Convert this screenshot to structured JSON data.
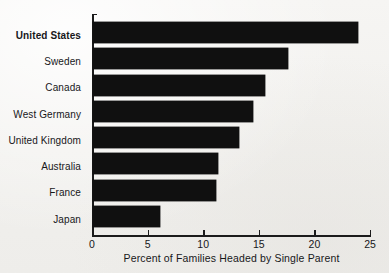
{
  "chart_data": {
    "type": "bar",
    "orientation": "horizontal",
    "title": "",
    "xlabel": "Percent of Families Headed by Single Parent",
    "ylabel": "",
    "xlim": [
      0,
      25
    ],
    "xticks": [
      0,
      5,
      10,
      15,
      20,
      25
    ],
    "xtick_labels": [
      "0",
      "5",
      "10",
      "15",
      "20",
      "25"
    ],
    "grid": false,
    "legend": null,
    "categories": [
      "United States",
      "Sweden",
      "Canada",
      "West Germany",
      "United Kingdom",
      "Australia",
      "France",
      "Japan"
    ],
    "values": [
      23.8,
      17.5,
      15.5,
      14.4,
      13.1,
      11.2,
      11.1,
      6.0
    ],
    "emphasized_category": "United States",
    "bar_color": "#101010",
    "background_color": "#f4f3f1",
    "axis_color": "#1b1b1b",
    "text_color": "#17171a"
  }
}
